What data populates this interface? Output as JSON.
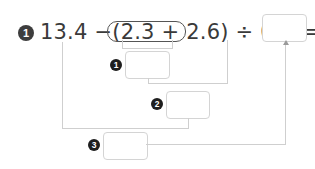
{
  "problem": {
    "number": "1",
    "expression": {
      "first": "13.4",
      "minus": "−",
      "open_paren": "(",
      "inner": "2.3 + 2.6",
      "close_paren": ")",
      "divide": "÷",
      "divisor": "0.5",
      "equals": "="
    },
    "final_answer": ""
  },
  "steps": [
    {
      "label": "1",
      "value": ""
    },
    {
      "label": "2",
      "value": ""
    },
    {
      "label": "3",
      "value": ""
    }
  ],
  "colors": {
    "text": "#3a3a3a",
    "badge": "#3d3d3d",
    "lines": "#cfcfcf",
    "box_border": "#d4d4d4"
  }
}
